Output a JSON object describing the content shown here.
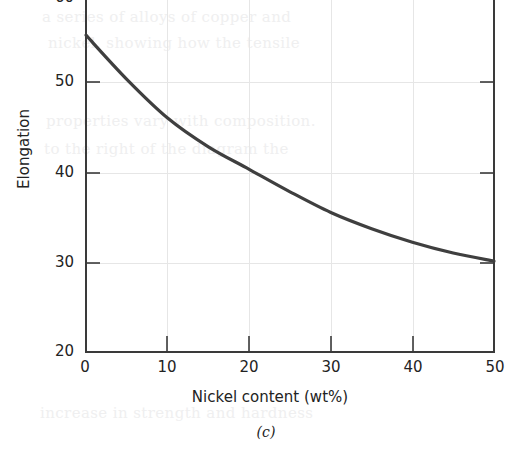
{
  "chart_data": {
    "type": "line",
    "title": "",
    "subtitle": "",
    "xlabel": "Nickel content (wt%)",
    "ylabel": "Elongation",
    "caption": "(c)",
    "xlim": [
      0,
      50
    ],
    "ylim": [
      20,
      60
    ],
    "xticks": [
      0,
      10,
      20,
      30,
      40,
      50
    ],
    "xtick_labels": [
      "0",
      "10",
      "20",
      "30",
      "40",
      "50"
    ],
    "yticks": [
      20,
      30,
      40,
      50,
      60
    ],
    "ytick_labels": [
      "20",
      "30",
      "40",
      "50",
      "60"
    ],
    "grid": true,
    "legend": null,
    "series": [
      {
        "name": "Elongation vs nickel content",
        "x": [
          0,
          5,
          10,
          15,
          20,
          25,
          30,
          35,
          40,
          45,
          50
        ],
        "values": [
          55.2,
          50.3,
          46.0,
          42.8,
          40.3,
          37.8,
          35.5,
          33.7,
          32.2,
          31.0,
          30.1
        ],
        "color": "#3f3f3f",
        "line_width": 3.2
      }
    ]
  },
  "axes": {
    "y_title": "Elongation",
    "x_title": "Nickel content (wt%)",
    "y_tick_labels": [
      "20",
      "30",
      "40",
      "50",
      "60"
    ],
    "x_tick_labels": [
      "0",
      "10",
      "20",
      "30",
      "40",
      "50"
    ]
  },
  "figure": {
    "caption": "(c)"
  },
  "background_bleed": {
    "lines": [
      "a series of alloys of copper and",
      "nickel, showing how the tensile",
      "properties vary with composition.",
      "to the right of the diagram the",
      "increase in strength and hardness"
    ]
  },
  "colors": {
    "curve": "#3f3f3f",
    "axis": "#3a3a3a",
    "grid": "#e3e3e3",
    "text": "#232323",
    "background": "#ffffff"
  }
}
